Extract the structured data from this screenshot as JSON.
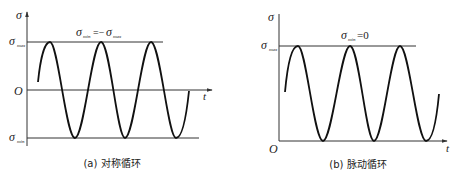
{
  "panels": [
    {
      "id": "a",
      "caption": "(a) 对称循环",
      "y_axis_label": "σ",
      "x_axis_label": "t",
      "origin_label": "O",
      "level_labels": {
        "max": "σ",
        "max_sub": "max",
        "min": "σ",
        "min_sub": "min"
      },
      "annotation": {
        "lhs": "σ",
        "lhs_sub": "min",
        "eq": "=−",
        "rhs": "σ",
        "rhs_sub": "max"
      }
    },
    {
      "id": "b",
      "caption": "(b) 脉动循环",
      "y_axis_label": "σ",
      "x_axis_label": "t",
      "origin_label": "O",
      "level_labels": {
        "max": "σ",
        "max_sub": "max"
      },
      "annotation": {
        "lhs": "σ",
        "lhs_sub": "min",
        "eq": "=0"
      }
    }
  ],
  "colors": {
    "line": "#111111",
    "axis": "#333333",
    "text": "#222222"
  }
}
